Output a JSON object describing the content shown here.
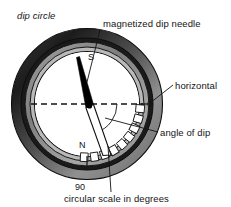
{
  "figure": {
    "title": "dip circle",
    "type": "labeled-diagram",
    "canvas": {
      "width": 231,
      "height": 207
    }
  },
  "labels": {
    "title": "dip circle",
    "needle": "magnetized dip needle",
    "horizontal": "horizontal",
    "zero": "0",
    "angle_of_dip": "angle of dip",
    "ninety": "90",
    "scale": "circular scale in degrees",
    "north": "N",
    "south": "S"
  },
  "colors": {
    "outer_ring_dark": "#2b2b2b",
    "outer_ring_black": "#111111",
    "ring_gray": "#8f8f8f",
    "ring_light_gray": "#b8b8b8",
    "face_white": "#ffffff",
    "needle_black": "#000000",
    "line_black": "#111111",
    "background": "#ffffff"
  },
  "geometry": {
    "center_x": 87,
    "center_y": 104,
    "outer_radius": 76,
    "inner_face_radius": 52,
    "needle_tip_top": {
      "x": 79,
      "y": 56
    },
    "needle_tip_bottom": {
      "x": 111,
      "y": 155
    },
    "horizontal_line_y": 104,
    "angle_of_dip_degrees": 72,
    "scale_zero_position": "right",
    "scale_ninety_position": "bottom"
  },
  "scale": {
    "segment_count": 9,
    "start_angle_deg": 8,
    "end_angle_deg": 96,
    "note": "white rectangular graduation blocks on inner ring, lower-right quadrant"
  }
}
